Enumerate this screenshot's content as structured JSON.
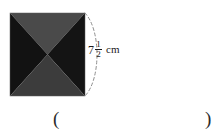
{
  "figure": {
    "name": "square-pyramid-net",
    "shape_description": "square divided by diagonals into four triangles",
    "square": {
      "x": 10,
      "y": 13,
      "width": 75,
      "height": 83
    },
    "triangles": [
      {
        "name": "top-triangle",
        "fill": "#4a4a4a"
      },
      {
        "name": "left-triangle",
        "fill": "#121212"
      },
      {
        "name": "right-triangle",
        "fill": "#141414"
      },
      {
        "name": "bottom-triangle",
        "fill": "#3c3c3c"
      }
    ],
    "arc": {
      "name": "dimension-arc",
      "style": "dashed",
      "color": "#8a8a8a"
    }
  },
  "dimension": {
    "whole": "7",
    "numerator": "1",
    "denominator": "2",
    "unit": "cm",
    "full_text": "7 1/2 cm"
  },
  "answer": {
    "paren_open": "(",
    "paren_close": ")",
    "value": ""
  }
}
